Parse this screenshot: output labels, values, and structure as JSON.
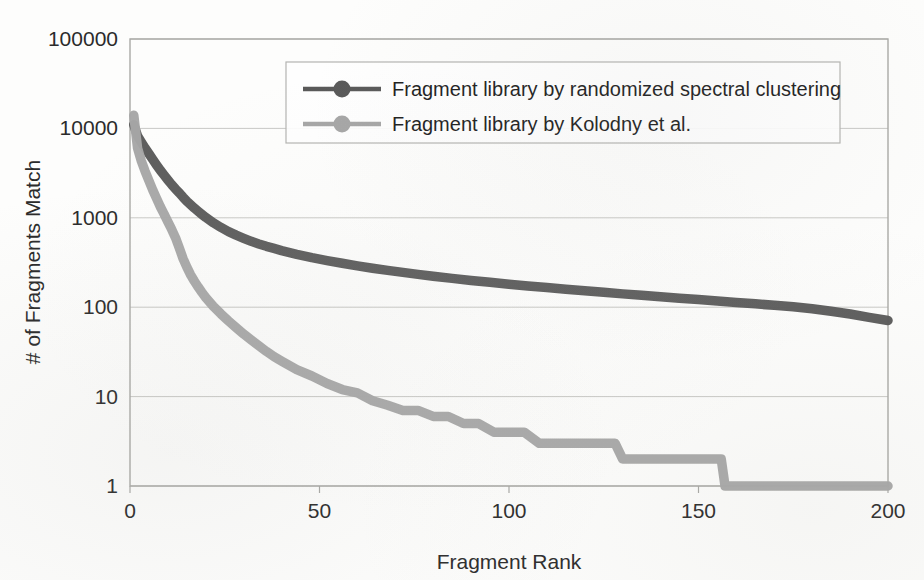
{
  "chart_data": {
    "type": "line",
    "title": "",
    "xlabel": "Fragment Rank",
    "ylabel": "# of Fragments Match",
    "xlim": [
      0,
      200
    ],
    "ylim": [
      1,
      100000
    ],
    "yscale": "log",
    "grid": true,
    "x_ticks": [
      "0",
      "50",
      "100",
      "150",
      "200"
    ],
    "x_tick_values": [
      0,
      50,
      100,
      150,
      200
    ],
    "y_ticks": [
      "1",
      "10",
      "100",
      "1000",
      "10000",
      "100000"
    ],
    "y_tick_values": [
      1,
      10,
      100,
      1000,
      10000,
      100000
    ],
    "legend_position": "top-center-right",
    "series": [
      {
        "name": "Fragment library by randomized spectral clustering",
        "color": "#595959",
        "marker": "circle",
        "x": [
          1,
          2,
          3,
          4,
          5,
          6,
          7,
          8,
          9,
          10,
          11,
          12,
          13,
          14,
          15,
          16,
          17,
          18,
          19,
          20,
          22,
          24,
          26,
          28,
          30,
          32,
          34,
          36,
          38,
          40,
          44,
          48,
          52,
          56,
          60,
          64,
          68,
          72,
          76,
          80,
          85,
          90,
          95,
          100,
          105,
          110,
          115,
          120,
          125,
          130,
          135,
          140,
          145,
          150,
          155,
          160,
          165,
          170,
          175,
          180,
          185,
          190,
          195,
          200
        ],
        "values": [
          11000,
          8200,
          7000,
          6000,
          5200,
          4500,
          3900,
          3400,
          3000,
          2650,
          2350,
          2100,
          1900,
          1700,
          1530,
          1400,
          1280,
          1180,
          1090,
          1010,
          880,
          780,
          700,
          640,
          590,
          545,
          510,
          480,
          455,
          430,
          390,
          358,
          332,
          310,
          290,
          273,
          258,
          245,
          233,
          222,
          210,
          199,
          190,
          181,
          173,
          166,
          159,
          153,
          147,
          141,
          136,
          131,
          126,
          122,
          117,
          113,
          109,
          105,
          101,
          96,
          90,
          84,
          77,
          71
        ]
      },
      {
        "name": "Fragment library by Kolodny et al.",
        "color": "#a6a6a6",
        "marker": "circle",
        "x": [
          1,
          2,
          3,
          4,
          5,
          6,
          7,
          8,
          9,
          10,
          11,
          12,
          13,
          14,
          15,
          16,
          17,
          18,
          19,
          20,
          22,
          24,
          26,
          28,
          30,
          32,
          34,
          36,
          38,
          40,
          44,
          48,
          52,
          56,
          60,
          64,
          68,
          72,
          76,
          80,
          84,
          88,
          92,
          96,
          100,
          104,
          108,
          112,
          116,
          120,
          124,
          128,
          130,
          134,
          140,
          146,
          152,
          156,
          157,
          160,
          166,
          172,
          180,
          190,
          200
        ],
        "values": [
          14000,
          6000,
          4300,
          3300,
          2600,
          2050,
          1650,
          1330,
          1100,
          900,
          740,
          600,
          460,
          350,
          280,
          230,
          195,
          168,
          146,
          128,
          102,
          84,
          70,
          59,
          50,
          43,
          37,
          32,
          28,
          25,
          20,
          17,
          14,
          12,
          11,
          9,
          8,
          7,
          7,
          6,
          6,
          5,
          5,
          4,
          4,
          4,
          3,
          3,
          3,
          3,
          3,
          3,
          2,
          2,
          2,
          2,
          2,
          2,
          1,
          1,
          1,
          1,
          1,
          1,
          1
        ]
      }
    ]
  },
  "legend": {
    "entries": [
      {
        "label": "Fragment library by randomized spectral clustering",
        "color": "#595959"
      },
      {
        "label": "Fragment library by Kolodny et al.",
        "color": "#a6a6a6"
      }
    ]
  },
  "axes": {
    "y_title": "# of Fragments Match",
    "x_title": "Fragment Rank",
    "y_tick_0": "1",
    "y_tick_1": "10",
    "y_tick_2": "100",
    "y_tick_3": "1000",
    "y_tick_4": "10000",
    "y_tick_5": "100000",
    "x_tick_0": "0",
    "x_tick_1": "50",
    "x_tick_2": "100",
    "x_tick_3": "150",
    "x_tick_4": "200"
  },
  "colors": {
    "series_dark": "#595959",
    "series_light": "#a6a6a6",
    "gridline": "#c9c9c6",
    "frame": "#a9a9a6",
    "text": "#2b2b2b",
    "background": "#fdfdfc"
  }
}
